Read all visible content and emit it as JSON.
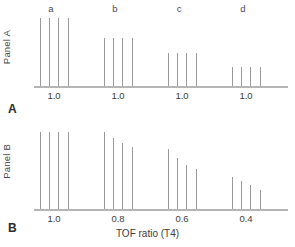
{
  "figure": {
    "x_axis_title": "TOF ratio (T4)",
    "bar_color": "#9a9a9a",
    "axis_color": "#b5b5b5",
    "text_color": "#3c3c3c"
  },
  "panels": [
    {
      "key": "a",
      "side_label": "Panel A",
      "letter": "A",
      "tick_labels": [
        "1.0",
        "1.0",
        "1.0",
        "1.0"
      ],
      "group_letters": [
        "a",
        "b",
        "c",
        "d"
      ]
    },
    {
      "key": "b",
      "side_label": "Panel B",
      "letter": "B",
      "tick_labels": [
        "1.0",
        "0.8",
        "0.6",
        "0.4"
      ],
      "group_letters": []
    }
  ],
  "chart_data": {
    "type": "bar",
    "title": "",
    "xlabel": "TOF ratio (T4)",
    "ylabel": "",
    "grid": false,
    "legend": "none",
    "subplots": [
      {
        "name": "Panel A",
        "letter": "A",
        "xlabel": "",
        "ylabel": "Panel A",
        "tick_labels": [
          "1.0",
          "1.0",
          "1.0",
          "1.0"
        ],
        "tick_x": [
          54,
          118,
          182,
          246
        ],
        "groups": [
          {
            "label": "a",
            "label_x": 51,
            "tof_ratio": "1.0",
            "twitch_x": [
              40,
              49,
              58,
              68
            ],
            "twitch_heights": [
              68,
              68,
              68,
              68
            ]
          },
          {
            "label": "b",
            "label_x": 115,
            "tof_ratio": "1.0",
            "twitch_x": [
              104,
              113,
              122,
              132
            ],
            "twitch_heights": [
              48,
              48,
              48,
              48
            ]
          },
          {
            "label": "c",
            "label_x": 179,
            "tof_ratio": "1.0",
            "twitch_x": [
              168,
              177,
              186,
              196
            ],
            "twitch_heights": [
              33,
              33,
              33,
              33
            ]
          },
          {
            "label": "d",
            "label_x": 243,
            "tof_ratio": "1.0",
            "twitch_x": [
              232,
              241,
              250,
              260
            ],
            "twitch_heights": [
              19,
              19,
              19,
              19
            ]
          }
        ]
      },
      {
        "name": "Panel B",
        "letter": "B",
        "xlabel": "TOF ratio (T4)",
        "ylabel": "Panel B",
        "tick_labels": [
          "1.0",
          "0.8",
          "0.6",
          "0.4"
        ],
        "tick_x": [
          54,
          118,
          182,
          246
        ],
        "groups": [
          {
            "label": "",
            "tof_ratio": "1.0",
            "twitch_x": [
              40,
              49,
              58,
              68
            ],
            "twitch_heights": [
              77,
              77,
              77,
              77
            ]
          },
          {
            "label": "",
            "tof_ratio": "0.8",
            "twitch_x": [
              104,
              113,
              122,
              132
            ],
            "twitch_heights": [
              77,
              71,
              66,
              62
            ]
          },
          {
            "label": "",
            "tof_ratio": "0.6",
            "twitch_x": [
              168,
              177,
              186,
              196
            ],
            "twitch_heights": [
              60,
              51,
              44,
              40
            ]
          },
          {
            "label": "",
            "tof_ratio": "0.4",
            "twitch_x": [
              232,
              241,
              250,
              260
            ],
            "twitch_heights": [
              32,
              28,
              24,
              19
            ]
          }
        ]
      }
    ]
  }
}
